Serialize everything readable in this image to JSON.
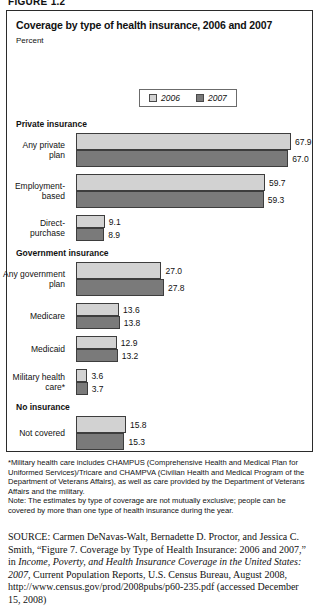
{
  "figure_label": "FIGURE 1.2",
  "chart": {
    "title": "Coverage by type of health insurance, 2006 and 2007",
    "axis_unit": "Percent",
    "legend": [
      {
        "label": "2006",
        "color": "#d2d2d2"
      },
      {
        "label": "2007",
        "color": "#7a7a7a"
      }
    ]
  },
  "notes": {
    "footnote": "*Military health care includes CHAMPUS (Comprehensive Health and Medical Plan for Uniformed Services)/Tricare and CHAMPVA (Civilian Health and Medical Program of the Department of Veterans Affairs), as well as care provided by the Department of Veterans Affairs and the military.",
    "note": "Note: The estimates by type of coverage are not mutually exclusive; people can be covered by more than one type of health insurance during the year."
  },
  "source": {
    "keyword": "SOURCE:",
    "part1": " Carmen DeNavas-Walt, Bernadette D. Proctor, and Jessica C. Smith, “Figure 7. Coverage by Type of Health Insurance: 2006 and 2007,” in ",
    "italic_title": "Income, Poverty, and Health Insurance Coverage in the United States: 2007",
    "part2": ", Current Population Reports, U.S. Census Bureau, August 2008, http://www.census.gov/prod/2008pubs/p60-235.pdf (accessed December 15, 2008)"
  },
  "chart_data": {
    "type": "bar",
    "orientation": "horizontal",
    "title": "Coverage by type of health insurance, 2006 and 2007",
    "xlabel": "Percent",
    "ylabel": "",
    "xlim": [
      0,
      70
    ],
    "grid": false,
    "legend_position": "top-center",
    "sections": [
      {
        "name": "Private insurance",
        "categories": [
          {
            "label": "Any private\nplan",
            "values": {
              "2006": 67.9,
              "2007": 67.0
            }
          },
          {
            "label": "Employment-\nbased",
            "values": {
              "2006": 59.7,
              "2007": 59.3
            }
          },
          {
            "label": "Direct-\npurchase",
            "values": {
              "2006": 9.1,
              "2007": 8.9
            }
          }
        ]
      },
      {
        "name": "Government insurance",
        "categories": [
          {
            "label": "Any government\nplan",
            "values": {
              "2006": 27.0,
              "2007": 27.8
            }
          },
          {
            "label": "Medicare",
            "values": {
              "2006": 13.6,
              "2007": 13.8
            }
          },
          {
            "label": "Medicaid",
            "values": {
              "2006": 12.9,
              "2007": 13.2
            }
          },
          {
            "label": "Military health\ncare*",
            "values": {
              "2006": 3.6,
              "2007": 3.7
            }
          }
        ]
      },
      {
        "name": "No insurance",
        "categories": [
          {
            "label": "Not covered",
            "values": {
              "2006": 15.8,
              "2007": 15.3
            }
          }
        ]
      }
    ],
    "series": [
      {
        "name": "2006",
        "values": [
          67.9,
          59.7,
          9.1,
          27.0,
          13.6,
          12.9,
          3.6,
          15.8
        ]
      },
      {
        "name": "2007",
        "values": [
          67.0,
          59.3,
          8.9,
          27.8,
          13.8,
          13.2,
          3.7,
          15.3
        ]
      }
    ],
    "categories": [
      "Any private plan",
      "Employment-based",
      "Direct-purchase",
      "Any government plan",
      "Medicare",
      "Medicaid",
      "Military health care*",
      "Not covered"
    ]
  }
}
